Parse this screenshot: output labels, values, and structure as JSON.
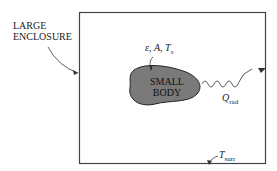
{
  "enclosure_label": [
    "LARGE",
    "ENCLOSURE"
  ],
  "body_label": [
    "SMALL",
    "BODY"
  ],
  "body_properties": "ε, A, T",
  "body_properties_sub": "s",
  "radiation_symbol": "Q",
  "radiation_sub": "rad",
  "surroundings_symbol": "T",
  "surroundings_sub": "surr",
  "colors": {
    "body_fill": "#7a7a7a",
    "line": "#333333"
  }
}
